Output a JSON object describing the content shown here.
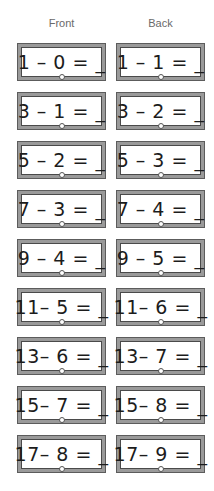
{
  "headers": {
    "front": "Front",
    "back": "Back"
  },
  "cards": [
    {
      "front": "1 – 0 = _",
      "back": "1 – 1 = _"
    },
    {
      "front": "3 – 1 = _",
      "back": "3 – 2 = _"
    },
    {
      "front": "5 – 2 = _",
      "back": "5 – 3 = _"
    },
    {
      "front": "7 – 3 = _",
      "back": "7 – 4 = _"
    },
    {
      "front": "9 – 4 = _",
      "back": "9 – 5 = _"
    },
    {
      "front": "11– 5 = _",
      "back": "11– 6 = _"
    },
    {
      "front": "13– 6 = _",
      "back": "13– 7 = _"
    },
    {
      "front": "15– 7 = _",
      "back": "15– 8 = _"
    },
    {
      "front": "17– 8 = _",
      "back": "17– 9 = _"
    }
  ],
  "colors": {
    "frame": "#9a9a9a",
    "frame_line": "#5c5c5c",
    "text": "#1c1c1c",
    "header_text": "#6a6a6a"
  }
}
